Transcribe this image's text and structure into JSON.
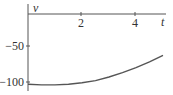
{
  "chart_data": {
    "type": "line",
    "title": "",
    "xlabel": "t",
    "ylabel": "v",
    "xlim": [
      0,
      5.1
    ],
    "ylim": [
      -108,
      5
    ],
    "x_ticks": [
      2,
      4
    ],
    "x_tick_labels": [
      "2",
      "4"
    ],
    "y_ticks": [
      -50,
      -100
    ],
    "y_tick_labels": [
      "−50",
      "−100"
    ],
    "grid": false,
    "legend": null,
    "series": [
      {
        "name": "v(t)",
        "color": "#555555",
        "x": [
          0,
          0.5,
          1,
          1.5,
          2,
          2.5,
          3,
          3.5,
          4,
          4.5,
          5
        ],
        "y": [
          -103,
          -104,
          -104,
          -103,
          -101,
          -98,
          -93,
          -87,
          -80,
          -72,
          -63
        ]
      }
    ]
  }
}
